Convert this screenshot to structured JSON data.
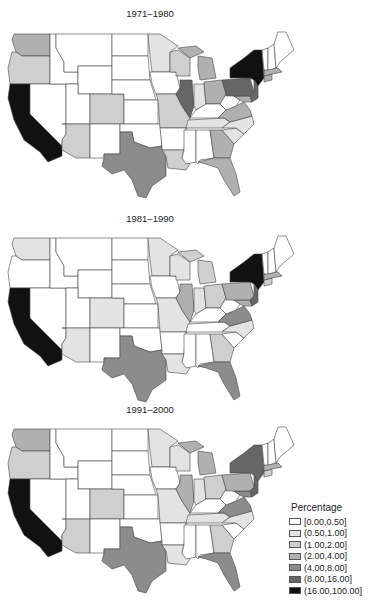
{
  "panels": [
    {
      "title": "1971–1980",
      "key": "p1"
    },
    {
      "title": "1981–1990",
      "key": "p2"
    },
    {
      "title": "1991–2000",
      "key": "p3"
    }
  ],
  "legend": {
    "title": "Percentage",
    "items": [
      {
        "label": "[0.00,0.50]",
        "color": "#ffffff"
      },
      {
        "label": "(0.50,1.00]",
        "color": "#e3e3e3"
      },
      {
        "label": "(1.00,2.00]",
        "color": "#cfcfcf"
      },
      {
        "label": "(2.00,4.00]",
        "color": "#b0b0b0"
      },
      {
        "label": "(4.00,8.00]",
        "color": "#8c8c8c"
      },
      {
        "label": "(8.00,16.00]",
        "color": "#666666"
      },
      {
        "label": "(16.00,100.00]",
        "color": "#111111"
      }
    ]
  },
  "chart_data": {
    "type": "heatmap",
    "subtype": "choropleth",
    "title": "",
    "legend_title": "Percentage",
    "bins": [
      "[0.00,0.50]",
      "(0.50,1.00]",
      "(1.00,2.00]",
      "(2.00,4.00]",
      "(4.00,8.00]",
      "(8.00,16.00]",
      "(16.00,100.00]"
    ],
    "legend_position": "bottom-right",
    "maps": [
      {
        "title": "1971–1980",
        "states": {
          "WA": 3,
          "OR": 2,
          "CA": 6,
          "NV": 0,
          "ID": 0,
          "MT": 0,
          "WY": 0,
          "UT": 0,
          "CO": 2,
          "AZ": 2,
          "NM": 0,
          "ND": 0,
          "SD": 0,
          "NE": 0,
          "KS": 0,
          "OK": 0,
          "TX": 4,
          "MN": 1,
          "IA": 0,
          "MO": 2,
          "AR": 0,
          "LA": 2,
          "WI": 2,
          "IL": 5,
          "MI": 3,
          "IN": 1,
          "OH": 3,
          "KY": 0,
          "TN": 1,
          "MS": 0,
          "AL": 0,
          "GA": 3,
          "FL": 3,
          "SC": 1,
          "NC": 1,
          "VA": 3,
          "WV": 0,
          "PA": 5,
          "NY": 6,
          "NJ": 5,
          "CT": 3,
          "MA": 3,
          "VT": 0,
          "NH": 0,
          "ME": 0,
          "MD": 3
        }
      },
      {
        "title": "1981–1990",
        "states": {
          "WA": 1,
          "OR": 0,
          "CA": 6,
          "NV": 0,
          "ID": 0,
          "MT": 0,
          "WY": 0,
          "UT": 0,
          "CO": 1,
          "AZ": 1,
          "NM": 0,
          "ND": 0,
          "SD": 0,
          "NE": 0,
          "KS": 0,
          "OK": 0,
          "TX": 4,
          "MN": 1,
          "IA": 0,
          "MO": 1,
          "AR": 0,
          "LA": 1,
          "WI": 1,
          "IL": 3,
          "MI": 2,
          "IN": 1,
          "OH": 2,
          "KY": 0,
          "TN": 0,
          "MS": 0,
          "AL": 0,
          "GA": 2,
          "FL": 4,
          "SC": 0,
          "NC": 1,
          "VA": 4,
          "WV": 0,
          "PA": 3,
          "NY": 6,
          "NJ": 5,
          "CT": 2,
          "MA": 3,
          "VT": 0,
          "NH": 0,
          "ME": 0,
          "MD": 3
        }
      },
      {
        "title": "1991–2000",
        "states": {
          "WA": 3,
          "OR": 2,
          "CA": 6,
          "NV": 0,
          "ID": 0,
          "MT": 0,
          "WY": 0,
          "UT": 0,
          "CO": 2,
          "AZ": 2,
          "NM": 0,
          "ND": 0,
          "SD": 0,
          "NE": 0,
          "KS": 0,
          "OK": 0,
          "TX": 4,
          "MN": 1,
          "IA": 0,
          "MO": 1,
          "AR": 0,
          "LA": 1,
          "WI": 1,
          "IL": 3,
          "MI": 3,
          "IN": 1,
          "OH": 2,
          "KY": 0,
          "TN": 1,
          "MS": 0,
          "AL": 0,
          "GA": 2,
          "FL": 4,
          "SC": 0,
          "NC": 1,
          "VA": 4,
          "WV": 0,
          "PA": 3,
          "NY": 5,
          "NJ": 5,
          "CT": 2,
          "MA": 3,
          "VT": 0,
          "NH": 0,
          "ME": 0,
          "MD": 4
        }
      }
    ]
  }
}
